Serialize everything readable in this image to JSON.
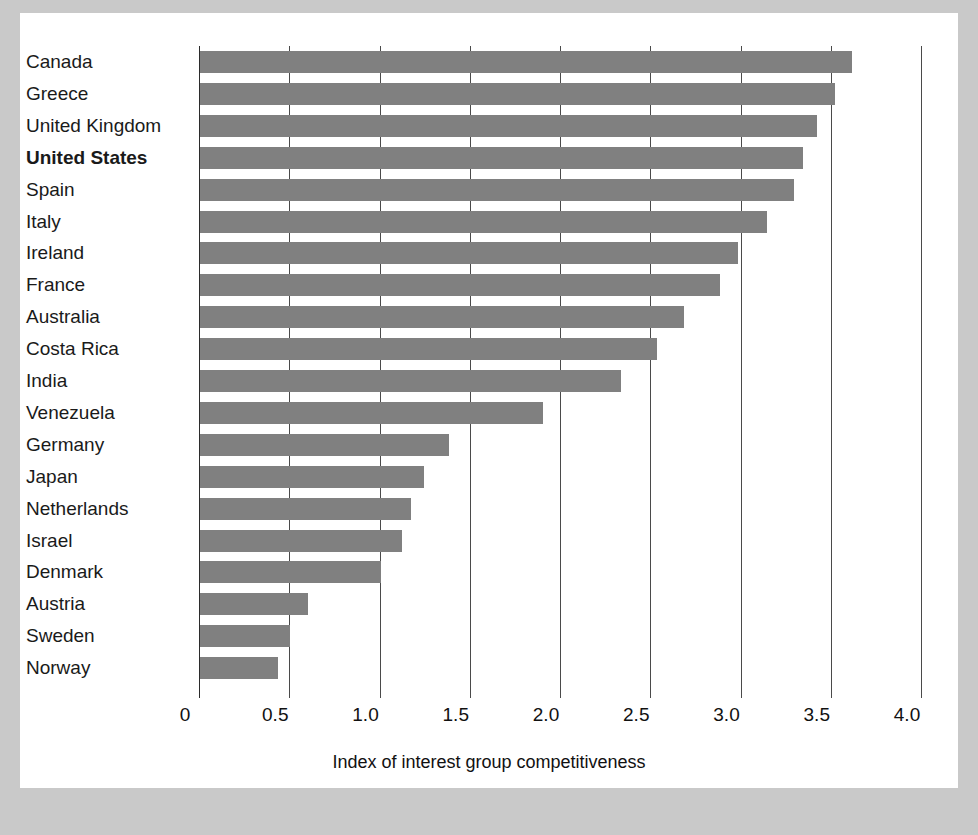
{
  "chart_data": {
    "type": "bar",
    "orientation": "horizontal",
    "title": "",
    "xlabel": "Index of interest group competitiveness",
    "ylabel": "",
    "xlim": [
      0,
      4.15
    ],
    "xticks": [
      0,
      0.5,
      1.0,
      1.5,
      2.0,
      2.5,
      3.0,
      3.5,
      4.0
    ],
    "xtick_labels": [
      "0",
      "0.5",
      "1.0",
      "1.5",
      "2.0",
      "2.5",
      "3.0",
      "3.5",
      "4.0"
    ],
    "grid": "vertical gridlines at each x tick",
    "legend": "none",
    "bar_color": "#808080",
    "highlight_label": "United States",
    "categories": [
      "Canada",
      "Greece",
      "United Kingdom",
      "United States",
      "Spain",
      "Italy",
      "Ireland",
      "France",
      "Australia",
      "Costa Rica",
      "India",
      "Venezuela",
      "Germany",
      "Japan",
      "Netherlands",
      "Israel",
      "Denmark",
      "Austria",
      "Sweden",
      "Norway"
    ],
    "values": [
      3.61,
      3.52,
      3.42,
      3.34,
      3.29,
      3.14,
      2.98,
      2.88,
      2.68,
      2.53,
      2.33,
      1.9,
      1.38,
      1.24,
      1.17,
      1.12,
      1.0,
      0.6,
      0.5,
      0.43
    ]
  },
  "colors": {
    "figure_background": "#c9c9c9",
    "panel_background": "#ffffff",
    "bar": "#808080",
    "gridline": "#4a4a4a",
    "text": "#1a1a1a"
  }
}
